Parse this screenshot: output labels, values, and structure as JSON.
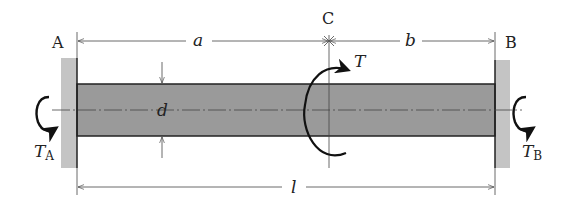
{
  "diagram": {
    "points": {
      "A": "A",
      "B": "B",
      "C": "C"
    },
    "dimensions": {
      "a": "a",
      "b": "b",
      "l": "l",
      "d": "d"
    },
    "torques": {
      "applied": "T",
      "reaction_a": "T",
      "reaction_a_sub": "A",
      "reaction_b": "T",
      "reaction_b_sub": "B"
    },
    "colors": {
      "shaft_fill": "#9a9a9a",
      "wall_fill": "#c4c4c4",
      "line": "#333333",
      "arrow": "#111111"
    }
  }
}
